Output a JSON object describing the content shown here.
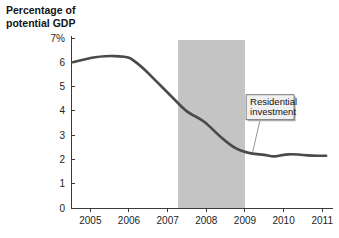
{
  "chart_data": {
    "type": "line",
    "title": "Percentage of potential GDP",
    "title_line1": "Percentage of",
    "title_line2": "potential GDP",
    "xlabel": "",
    "ylabel": "Percentage of potential GDP",
    "xlim": [
      2004.5,
      2011.2
    ],
    "ylim": [
      0,
      7
    ],
    "grid": false,
    "legend": "none",
    "y_ticks": [
      {
        "value": 7,
        "label": "7%"
      },
      {
        "value": 6,
        "label": "6"
      },
      {
        "value": 5,
        "label": "5"
      },
      {
        "value": 4,
        "label": "4"
      },
      {
        "value": 3,
        "label": "3"
      },
      {
        "value": 2,
        "label": "2"
      },
      {
        "value": 1,
        "label": "1"
      },
      {
        "value": 0,
        "label": "0"
      }
    ],
    "x_ticks": [
      {
        "value": 2005,
        "label": "2005"
      },
      {
        "value": 2006,
        "label": "2006"
      },
      {
        "value": 2007,
        "label": "2007"
      },
      {
        "value": 2008,
        "label": "2008"
      },
      {
        "value": 2009,
        "label": "2009"
      },
      {
        "value": 2010,
        "label": "2010"
      },
      {
        "value": 2011,
        "label": "2011"
      }
    ],
    "series": [
      {
        "name": "Residential investment",
        "color": "#4a4a4a",
        "x": [
          2004.55,
          2004.8,
          2005.0,
          2005.25,
          2005.5,
          2005.75,
          2006.0,
          2006.1,
          2006.3,
          2006.5,
          2006.75,
          2007.0,
          2007.25,
          2007.5,
          2007.75,
          2008.0,
          2008.25,
          2008.5,
          2008.75,
          2009.0,
          2009.25,
          2009.5,
          2009.75,
          2010.0,
          2010.25,
          2010.5,
          2010.75,
          2011.0,
          2011.1
        ],
        "y": [
          6.0,
          6.1,
          6.18,
          6.24,
          6.26,
          6.25,
          6.2,
          6.1,
          5.85,
          5.55,
          5.15,
          4.75,
          4.35,
          3.95,
          3.75,
          3.5,
          3.1,
          2.75,
          2.45,
          2.3,
          2.22,
          2.2,
          2.1,
          2.2,
          2.22,
          2.18,
          2.15,
          2.15,
          2.15
        ]
      }
    ],
    "shaded_regions": [
      {
        "name": "recession-band",
        "x_start": 2007.27,
        "x_end": 2009.0,
        "color": "#c4c4c4"
      }
    ],
    "annotations": [
      {
        "name": "residential-investment-callout",
        "line1": "Residential",
        "line2": "investment",
        "box_x": 2009.65,
        "box_y": 4.15,
        "point_x": 2009.2,
        "point_y": 2.3
      }
    ],
    "colors": {
      "line": "#4a4a4a",
      "band": "#c4c4c4",
      "axis": "#3a3a3a",
      "text": "#141414",
      "callout_fill": "#f0f0f0",
      "callout_border": "#6a6a6a"
    }
  }
}
